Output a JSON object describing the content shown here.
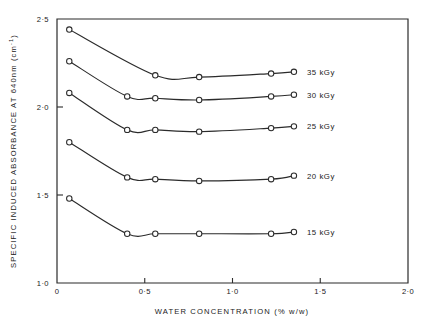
{
  "chart_data": {
    "type": "line",
    "title": "",
    "xlabel": "WATER CONCENTRATION (% w/w)",
    "ylabel": "SPECIFIC INDUCED ABSORBANCE AT 640nm (cm-1)",
    "ylabel_main": "SPECIFIC  INDUCED  ABSORBANCE  AT  640nm  (cm",
    "ylabel_sup": "-1",
    "ylabel_tail": ")",
    "xlim": [
      0,
      2.0
    ],
    "ylim": [
      1.0,
      2.5
    ],
    "grid": false,
    "legend_position": "right-of-curve-ends",
    "xticks": [
      0,
      0.5,
      1.0,
      1.5,
      2.0
    ],
    "xticklabels": [
      "0",
      "0·5",
      "1·0",
      "1·5",
      "2·0"
    ],
    "yticks": [
      1.0,
      1.5,
      2.0,
      2.5
    ],
    "yticklabels": [
      "1·0",
      "1·5",
      "2·0",
      "2·5"
    ],
    "marker": "open-circle",
    "series": [
      {
        "name": "35 kGy",
        "label": "35 kGy",
        "x": [
          0.07,
          0.56,
          0.81,
          1.22,
          1.35
        ],
        "y": [
          2.44,
          2.18,
          2.17,
          2.19,
          2.2
        ]
      },
      {
        "name": "30 kGy",
        "label": "30 kGy",
        "x": [
          0.07,
          0.4,
          0.56,
          0.81,
          1.22,
          1.35
        ],
        "y": [
          2.26,
          2.06,
          2.05,
          2.04,
          2.06,
          2.07
        ]
      },
      {
        "name": "25 kGy",
        "label": "25 kGy",
        "x": [
          0.07,
          0.4,
          0.56,
          0.81,
          1.22,
          1.35
        ],
        "y": [
          2.08,
          1.87,
          1.87,
          1.86,
          1.88,
          1.89
        ]
      },
      {
        "name": "20 kGy",
        "label": "20 kGy",
        "x": [
          0.07,
          0.4,
          0.56,
          0.81,
          1.22,
          1.35
        ],
        "y": [
          1.8,
          1.6,
          1.59,
          1.58,
          1.59,
          1.61
        ]
      },
      {
        "name": "15 kGy",
        "label": "15 kGy",
        "x": [
          0.07,
          0.4,
          0.56,
          0.81,
          1.22,
          1.35
        ],
        "y": [
          1.48,
          1.28,
          1.28,
          1.28,
          1.28,
          1.29
        ]
      }
    ]
  }
}
